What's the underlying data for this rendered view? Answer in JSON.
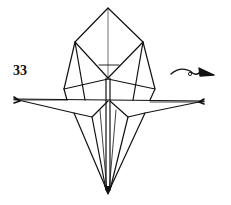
{
  "diagram": {
    "step_number": "33",
    "instruction_symbol": "turn-over-arrow",
    "line_color": "#111111",
    "background": "#ffffff"
  }
}
